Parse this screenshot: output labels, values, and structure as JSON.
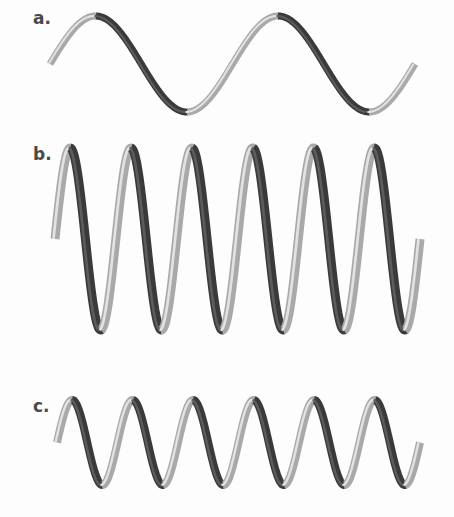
{
  "figure": {
    "panels": [
      {
        "label": "a.",
        "description": "long wavelength, large amplitude",
        "cycles": 2,
        "x_start": 50,
        "x_end": 415,
        "y_peak": 16,
        "y_trough": 112
      },
      {
        "label": "b.",
        "description": "short wavelength, large amplitude",
        "cycles": 6,
        "x_start": 55,
        "x_end": 420,
        "y_peak": 148,
        "y_trough": 330
      },
      {
        "label": "c.",
        "description": "short wavelength, small amplitude",
        "cycles": 6,
        "x_start": 57,
        "x_end": 420,
        "y_peak": 400,
        "y_trough": 485
      }
    ],
    "colors": {
      "ribbon_light": "#d8d8d8",
      "ribbon_mid": "#8a8a8a",
      "ribbon_dark": "#2e2e2e",
      "label": "#4a4a4a",
      "background": "#fdfdfd"
    }
  }
}
